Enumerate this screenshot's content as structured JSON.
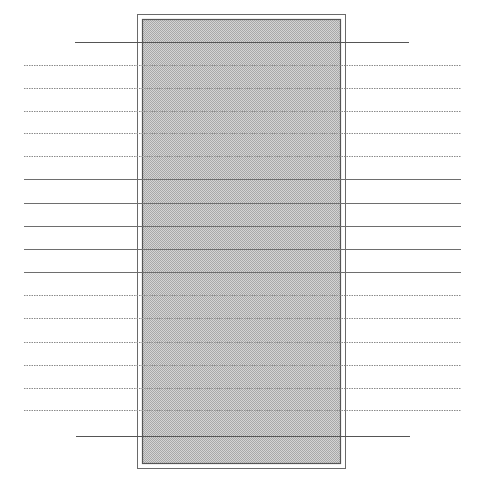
{
  "diagram": {
    "width": 485,
    "height": 498,
    "outer_frame": {
      "x": 137,
      "y": 14,
      "w": 208,
      "h": 454,
      "stroke": "#6a6a6a"
    },
    "inner_panel": {
      "x": 142,
      "y": 19,
      "w": 198,
      "h": 444,
      "stroke": "#555555",
      "fill_light": "#d4d4d4",
      "fill_dark": "#a8a8a8"
    },
    "boundary_lines": [
      {
        "y": 42,
        "x1": 75,
        "x2": 409,
        "style": "solid",
        "color": "#555555"
      },
      {
        "y": 436,
        "x1": 76,
        "x2": 410,
        "style": "solid",
        "color": "#555555"
      }
    ],
    "row_lines": [
      {
        "y": 65,
        "x1": 24,
        "x2": 461,
        "style": "dotted"
      },
      {
        "y": 88,
        "x1": 24,
        "x2": 461,
        "style": "dotted"
      },
      {
        "y": 111,
        "x1": 24,
        "x2": 461,
        "style": "dotted"
      },
      {
        "y": 133,
        "x1": 24,
        "x2": 461,
        "style": "dotted"
      },
      {
        "y": 156,
        "x1": 24,
        "x2": 461,
        "style": "dotted"
      },
      {
        "y": 179,
        "x1": 24,
        "x2": 461,
        "style": "solid"
      },
      {
        "y": 203,
        "x1": 24,
        "x2": 461,
        "style": "solid"
      },
      {
        "y": 226,
        "x1": 24,
        "x2": 461,
        "style": "solid"
      },
      {
        "y": 249,
        "x1": 24,
        "x2": 461,
        "style": "solid"
      },
      {
        "y": 272,
        "x1": 24,
        "x2": 461,
        "style": "solid"
      },
      {
        "y": 295,
        "x1": 24,
        "x2": 461,
        "style": "dotted"
      },
      {
        "y": 318,
        "x1": 24,
        "x2": 461,
        "style": "dotted"
      },
      {
        "y": 342,
        "x1": 24,
        "x2": 461,
        "style": "dotted"
      },
      {
        "y": 365,
        "x1": 24,
        "x2": 461,
        "style": "dotted"
      },
      {
        "y": 388,
        "x1": 24,
        "x2": 461,
        "style": "dotted"
      },
      {
        "y": 410,
        "x1": 24,
        "x2": 461,
        "style": "dotted"
      }
    ],
    "line_color_solid": "#6e6e6e",
    "line_color_dotted": "#8a8a8a"
  }
}
